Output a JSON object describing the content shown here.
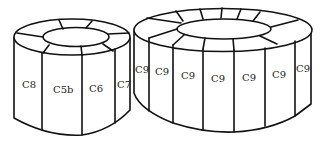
{
  "diagram": {
    "stroke_color": "#111111",
    "background": "#ffffff",
    "left_ring": {
      "labels": [
        "C8",
        "C5b",
        "C6",
        "C7"
      ]
    },
    "right_ring": {
      "labels": [
        "C9",
        "C9",
        "C9",
        "C9",
        "C9",
        "C9",
        "C9"
      ]
    }
  }
}
